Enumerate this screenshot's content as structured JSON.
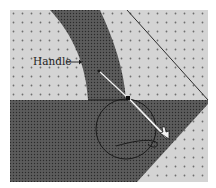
{
  "diagram": {
    "label": "Handle",
    "colors": {
      "light_fill": "#d4d4d4",
      "dark_fill": "#5a5a5a",
      "dot_light": "#6e6e6e",
      "dot_dark": "#2a2a2a",
      "line": "#1a1a1a",
      "handle": "#f2f2f2"
    }
  }
}
